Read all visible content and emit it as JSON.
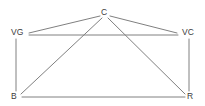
{
  "diagram": {
    "type": "undirected-graph",
    "title": "",
    "background_color": "#ffffff",
    "edge_color": "#808080",
    "edge_width": 1,
    "label_color": "#3b3b3b",
    "nodes": [
      {
        "id": "C",
        "label": "C",
        "x": 104,
        "y": 12
      },
      {
        "id": "VG",
        "label": "VG",
        "x": 17,
        "y": 32
      },
      {
        "id": "VC",
        "label": "VC",
        "x": 188,
        "y": 32
      },
      {
        "id": "B",
        "label": "B",
        "x": 14,
        "y": 96
      },
      {
        "id": "R",
        "label": "R",
        "x": 190,
        "y": 96
      }
    ],
    "edges": [
      {
        "from": "C",
        "to": "VG",
        "x1": 100,
        "y1": 16,
        "x2": 29,
        "y2": 33
      },
      {
        "from": "C",
        "to": "VC",
        "x1": 110,
        "y1": 16,
        "x2": 177,
        "y2": 33
      },
      {
        "from": "C",
        "to": "B",
        "x1": 102,
        "y1": 18,
        "x2": 21,
        "y2": 94
      },
      {
        "from": "C",
        "to": "R",
        "x1": 108,
        "y1": 18,
        "x2": 185,
        "y2": 94
      },
      {
        "from": "VG",
        "to": "VC",
        "x1": 29,
        "y1": 35,
        "x2": 178,
        "y2": 35
      },
      {
        "from": "VG",
        "to": "B",
        "x1": 16,
        "y1": 39,
        "x2": 16,
        "y2": 91
      },
      {
        "from": "VC",
        "to": "R",
        "x1": 189,
        "y1": 39,
        "x2": 189,
        "y2": 91
      },
      {
        "from": "B",
        "to": "R",
        "x1": 22,
        "y1": 97,
        "x2": 185,
        "y2": 97
      }
    ]
  }
}
